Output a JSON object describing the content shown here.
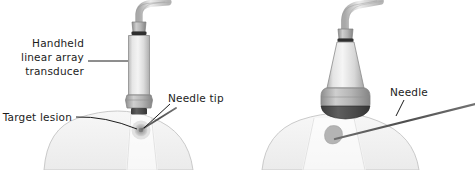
{
  "figure": {
    "background_color": "#ffffff",
    "ink_color": "#1c1c1c",
    "panels": [
      {
        "id": "left",
        "name": "linear-array-transducer-panel",
        "transducer_type": "handheld linear array transducer",
        "labels": [
          {
            "id": "transducer",
            "text_lines": [
              "Handheld",
              "linear array",
              "transducer"
            ]
          },
          {
            "id": "needle-tip",
            "text_lines": [
              "Needle tip"
            ]
          },
          {
            "id": "target-lesion",
            "text_lines": [
              "Target lesion"
            ]
          }
        ]
      },
      {
        "id": "right",
        "name": "curved-array-transducer-panel",
        "transducer_type": "curved array transducer",
        "labels": [
          {
            "id": "needle",
            "text_lines": [
              "Needle"
            ]
          }
        ]
      }
    ],
    "colors": {
      "skin_fill": "#f3f3f3",
      "skin_stroke": "#bdbdbd",
      "probe_body_light": "#f0f0f0",
      "probe_body_mid": "#d2d2d2",
      "probe_body_dark": "#a8a8a8",
      "probe_collar": "#9a9a9a",
      "probe_footprint": "#4a4a4a",
      "cable": "#cfcfcf",
      "cable_stroke": "#8f8f8f",
      "lesion": "#b0b0b0",
      "lesion_core": "#8a8a8a",
      "needle": "#5d5d5d",
      "beam": "#e3e3e3",
      "leader_line": "#1c1c1c"
    }
  },
  "labels": {
    "handheld": "Handheld",
    "linear_array": "linear array",
    "transducer": "transducer",
    "needle_tip": "Needle tip",
    "target_lesion": "Target lesion",
    "needle": "Needle"
  }
}
